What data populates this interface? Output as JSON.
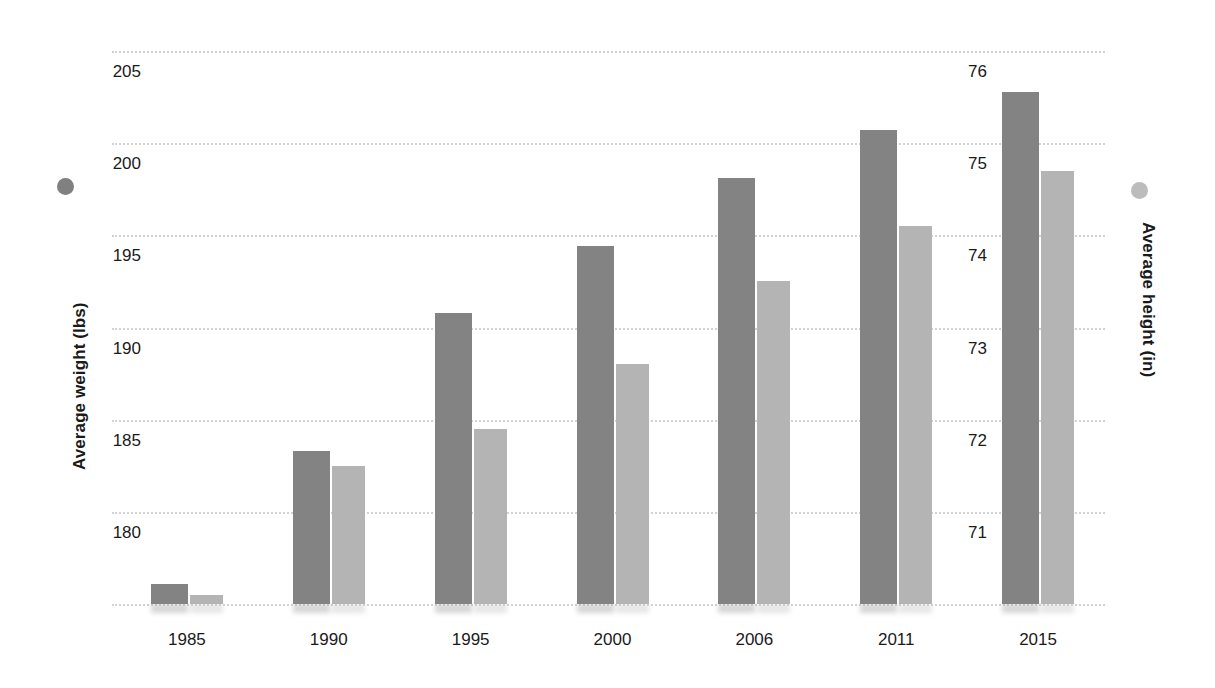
{
  "chart_data": {
    "type": "bar",
    "title": "",
    "subtitle": "",
    "categories": [
      "1985",
      "1990",
      "1995",
      "2000",
      "2006",
      "2011",
      "2015"
    ],
    "series": [
      {
        "name": "Average weight (lbs)",
        "axis": "left",
        "color": "#838383",
        "values": [
          176.1,
          183.3,
          190.8,
          194.4,
          198.1,
          200.7,
          202.8
        ]
      },
      {
        "name": "Average height (in)",
        "axis": "right",
        "color": "#b4b4b4",
        "values": [
          70.1,
          71.5,
          71.9,
          72.6,
          73.5,
          74.1,
          74.7
        ]
      }
    ],
    "xlabel": "",
    "ylabel_left": "Average weight (lbs)",
    "ylabel_right": "Average height (in)",
    "ylim_left": [
      175,
      205
    ],
    "ylim_right": [
      70,
      76
    ],
    "yticks_left": [
      "180",
      "185",
      "190",
      "195",
      "200",
      "205"
    ],
    "yticks_right": [
      "71",
      "72",
      "73",
      "74",
      "75",
      "76"
    ],
    "grid": true,
    "gridline_count": 7,
    "legend_position": "axis-titles",
    "colors": {
      "weight_bar": "#838383",
      "height_bar": "#b4b4b4",
      "gridline": "#d2d2d2",
      "text": "#1a1a1a",
      "background": "#ffffff"
    }
  },
  "axes": {
    "left": {
      "title": "Average weight (lbs)",
      "marker_color": "#808080",
      "ticks": [
        {
          "label": "205",
          "value": 205
        },
        {
          "label": "200",
          "value": 200
        },
        {
          "label": "195",
          "value": 195
        },
        {
          "label": "190",
          "value": 190
        },
        {
          "label": "185",
          "value": 185
        },
        {
          "label": "180",
          "value": 180
        }
      ]
    },
    "right": {
      "title": "Average height (in)",
      "marker_color": "#bcbcbc",
      "ticks": [
        {
          "label": "76",
          "value": 76
        },
        {
          "label": "75",
          "value": 75
        },
        {
          "label": "74",
          "value": 74
        },
        {
          "label": "73",
          "value": 73
        },
        {
          "label": "72",
          "value": 72
        },
        {
          "label": "71",
          "value": 71
        }
      ]
    }
  }
}
